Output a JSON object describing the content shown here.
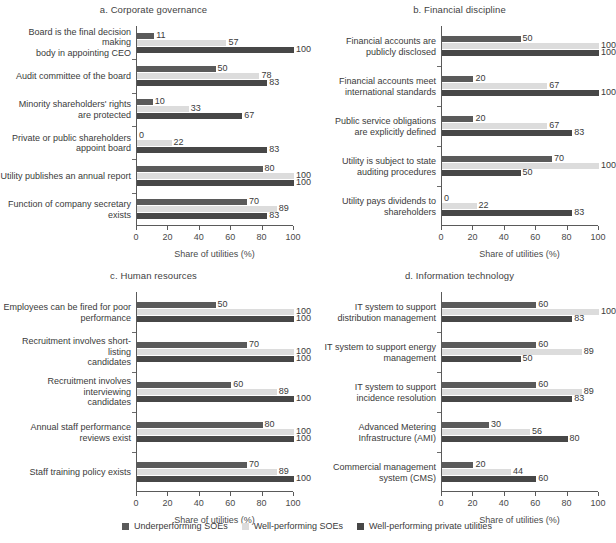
{
  "chart_data": {
    "type": "bar",
    "orientation": "horizontal",
    "title": "",
    "xlabel": "Share of utilities (%)",
    "ylabel": "",
    "xlim": [
      0,
      100
    ],
    "xticks": [
      0,
      20,
      40,
      60,
      80,
      100
    ],
    "grid": false,
    "legend_position": "bottom-center",
    "series_names": [
      "Underperforming SOEs",
      "Well-performing SOEs",
      "Well-performing private utilities"
    ],
    "series_colors": [
      "#5a5a5a",
      "#dcdcdc",
      "#474747"
    ],
    "panels": [
      {
        "title": "a. Corporate governance",
        "xlabel": "Share of utilities (%)",
        "categories": [
          "Board is the final decision making\nbody in appointing CEO",
          "Audit committee of the board",
          "Minority shareholders' rights\nare protected",
          "Private or public shareholders\nappoint board",
          "Utility publishes an annual report",
          "Function of company secretary\nexists"
        ],
        "series": [
          {
            "name": "Underperforming SOEs",
            "values": [
              11,
              50,
              10,
              0,
              80,
              70
            ]
          },
          {
            "name": "Well-performing SOEs",
            "values": [
              57,
              78,
              33,
              22,
              100,
              89
            ]
          },
          {
            "name": "Well-performing private utilities",
            "values": [
              100,
              83,
              67,
              83,
              100,
              83
            ]
          }
        ]
      },
      {
        "title": "b. Financial discipline",
        "xlabel": "Share of utilities (%)",
        "categories": [
          "Financial accounts are\npublicly disclosed",
          "Financial accounts meet\ninternational standards",
          "Public service obligations\nare explicitly defined",
          "Utility is subject to state\nauditing procedures",
          "Utility pays dividends to\nshareholders"
        ],
        "series": [
          {
            "name": "Underperforming SOEs",
            "values": [
              50,
              20,
              20,
              70,
              0
            ]
          },
          {
            "name": "Well-performing SOEs",
            "values": [
              100,
              67,
              67,
              100,
              22
            ]
          },
          {
            "name": "Well-performing private utilities",
            "values": [
              100,
              100,
              83,
              50,
              83
            ]
          }
        ]
      },
      {
        "title": "c. Human resources",
        "xlabel": "Share of utilities (%)",
        "categories": [
          "Employees can be fired for poor\nperformance",
          "Recruitment involves short-listing\ncandidates",
          "Recruitment involves interviewing\ncandidates",
          "Annual staff performance\nreviews exist",
          "Staff training policy exists"
        ],
        "series": [
          {
            "name": "Underperforming SOEs",
            "values": [
              50,
              70,
              60,
              80,
              70
            ]
          },
          {
            "name": "Well-performing SOEs",
            "values": [
              100,
              100,
              89,
              100,
              89
            ]
          },
          {
            "name": "Well-performing private utilities",
            "values": [
              100,
              100,
              100,
              100,
              100
            ]
          }
        ]
      },
      {
        "title": "d. Information technology",
        "xlabel": "Share of utilities (%)",
        "categories": [
          "IT system to support\ndistribution management",
          "IT system to support energy\nmanagement",
          "IT system to support\nincidence resolution",
          "Advanced Metering\nInfrastructure (AMI)",
          "Commercial management\nsystem (CMS)"
        ],
        "series": [
          {
            "name": "Underperforming SOEs",
            "values": [
              60,
              60,
              60,
              30,
              20
            ]
          },
          {
            "name": "Well-performing SOEs",
            "values": [
              100,
              89,
              89,
              56,
              44
            ]
          },
          {
            "name": "Well-performing private utilities",
            "values": [
              83,
              50,
              83,
              80,
              60
            ]
          }
        ]
      }
    ]
  },
  "legend": {
    "items": [
      {
        "label": "Underperforming SOEs",
        "color": "#5a5a5a"
      },
      {
        "label": "Well-performing SOEs",
        "color": "#dcdcdc"
      },
      {
        "label": "Well-performing private utilities",
        "color": "#474747"
      }
    ]
  }
}
